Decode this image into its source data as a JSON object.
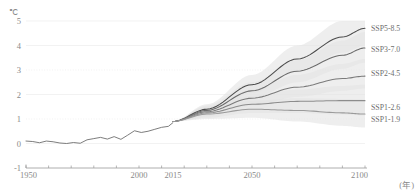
{
  "chart_data": {
    "type": "line",
    "title": "",
    "subtitle": "",
    "xlabel": "(年)",
    "ylabel": "℃",
    "unit_symbol": "℃",
    "xlim": [
      1950,
      2100
    ],
    "ylim": [
      -1,
      5
    ],
    "xticks": [
      1950,
      2000,
      2015,
      2050,
      2100
    ],
    "xticklabels": [
      "1950",
      "2000",
      "2015",
      "2050",
      "2100"
    ],
    "yticks": [
      -1,
      0,
      1,
      2,
      3,
      4,
      5
    ],
    "yticklabels": [
      "-1",
      "0",
      "1",
      "2",
      "3",
      "4",
      "5"
    ],
    "grid": true,
    "legend_position": "right-inline",
    "historical": {
      "name": "Historical observations",
      "x": [
        1950,
        1953,
        1956,
        1959,
        1962,
        1965,
        1968,
        1971,
        1974,
        1977,
        1980,
        1983,
        1986,
        1989,
        1992,
        1995,
        1998,
        2001,
        2004,
        2007,
        2010,
        2013,
        2015
      ],
      "y": [
        0.1,
        0.08,
        0.03,
        0.1,
        0.07,
        0.02,
        0.0,
        0.04,
        0.01,
        0.15,
        0.2,
        0.25,
        0.18,
        0.28,
        0.17,
        0.34,
        0.52,
        0.45,
        0.5,
        0.58,
        0.66,
        0.7,
        0.85
      ]
    },
    "series": [
      {
        "name": "SSP5-8.5",
        "label": "SSP5-8.5",
        "color": "#4a4a4a",
        "x": [
          2015,
          2030,
          2050,
          2070,
          2090,
          2100
        ],
        "y": [
          0.9,
          1.4,
          2.4,
          3.45,
          4.35,
          4.7
        ],
        "band_low": [
          0.9,
          1.2,
          2.05,
          2.95,
          3.7,
          4.0
        ],
        "band_high": [
          0.9,
          1.6,
          2.8,
          4.0,
          5.0,
          5.0
        ]
      },
      {
        "name": "SSP3-7.0",
        "label": "SSP3-7.0",
        "color": "#6b6b6b",
        "x": [
          2015,
          2030,
          2050,
          2070,
          2090,
          2100
        ],
        "y": [
          0.9,
          1.35,
          2.15,
          2.95,
          3.6,
          3.9
        ],
        "band_low": [
          0.9,
          1.15,
          1.85,
          2.5,
          3.05,
          3.3
        ],
        "band_high": [
          0.9,
          1.55,
          2.5,
          3.4,
          4.2,
          4.55
        ]
      },
      {
        "name": "SSP2-4.5",
        "label": "SSP2-4.5",
        "color": "#7a7a7a",
        "x": [
          2015,
          2030,
          2050,
          2070,
          2090,
          2100
        ],
        "y": [
          0.9,
          1.3,
          1.85,
          2.3,
          2.65,
          2.75
        ],
        "band_low": [
          0.9,
          1.1,
          1.55,
          1.9,
          2.15,
          2.25
        ],
        "band_high": [
          0.9,
          1.5,
          2.2,
          2.8,
          3.25,
          3.45
        ]
      },
      {
        "name": "SSP1-2.6",
        "label": "SSP1-2.6",
        "color": "#8c8c8c",
        "x": [
          2015,
          2030,
          2050,
          2070,
          2090,
          2100
        ],
        "y": [
          0.9,
          1.25,
          1.6,
          1.72,
          1.75,
          1.75
        ],
        "band_low": [
          0.9,
          1.05,
          1.25,
          1.25,
          1.18,
          1.15
        ],
        "band_high": [
          0.9,
          1.45,
          1.95,
          2.2,
          2.35,
          2.4
        ]
      },
      {
        "name": "SSP1-1.9",
        "label": "SSP1-1.9",
        "color": "#9a9a9a",
        "x": [
          2015,
          2030,
          2050,
          2070,
          2090,
          2100
        ],
        "y": [
          0.9,
          1.2,
          1.4,
          1.35,
          1.25,
          1.2
        ],
        "band_low": [
          0.9,
          1.0,
          1.05,
          0.9,
          0.72,
          0.65
        ],
        "band_high": [
          0.9,
          1.4,
          1.75,
          1.85,
          1.82,
          1.8
        ]
      }
    ],
    "band_color": "#e3e3e3",
    "axis_color": "#9a9a9a",
    "grid_color": "#ececec"
  }
}
